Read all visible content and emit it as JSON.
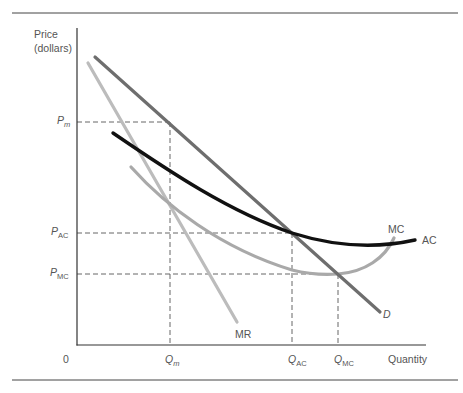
{
  "diagram": {
    "y_axis_label_line1": "Price",
    "y_axis_label_line2": "(dollars)",
    "x_axis_label": "Quantity",
    "origin_label": "0",
    "price_levels": [
      {
        "symbol": "P",
        "sub": "m",
        "sub_italic": true
      },
      {
        "symbol": "P",
        "sub": "AC",
        "sub_italic": false
      },
      {
        "symbol": "P",
        "sub": "MC",
        "sub_italic": false
      }
    ],
    "quantity_levels": [
      {
        "symbol": "Q",
        "sub": "m",
        "sub_italic": true
      },
      {
        "symbol": "Q",
        "sub": "AC",
        "sub_italic": false
      },
      {
        "symbol": "Q",
        "sub": "MC",
        "sub_italic": false
      }
    ],
    "curves": {
      "demand": {
        "label": "D",
        "color": "#6e6e6e"
      },
      "marginal_revenue": {
        "label": "MR",
        "color": "#bcbcbc"
      },
      "average_cost": {
        "label": "AC",
        "color": "#111111"
      },
      "marginal_cost": {
        "label": "MC",
        "color": "#a9a9a9"
      }
    },
    "colors": {
      "axis": "#333333",
      "rule": "#444444",
      "guide": "#555555",
      "text": "#555555"
    }
  }
}
